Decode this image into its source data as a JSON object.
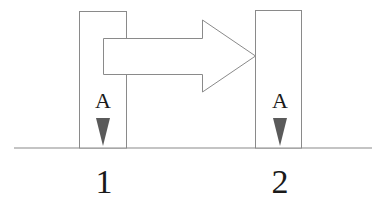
{
  "diagram": {
    "positions": [
      {
        "id": "1",
        "label": "1",
        "marker_label": "A"
      },
      {
        "id": "2",
        "label": "2",
        "marker_label": "A"
      }
    ],
    "arrow": {
      "from": "1",
      "to": "2",
      "direction": "right"
    },
    "colors": {
      "stroke": "#8a8a8a",
      "marker_fill": "#5a5a5a",
      "text": "#1a1a1a",
      "background": "#ffffff"
    }
  }
}
